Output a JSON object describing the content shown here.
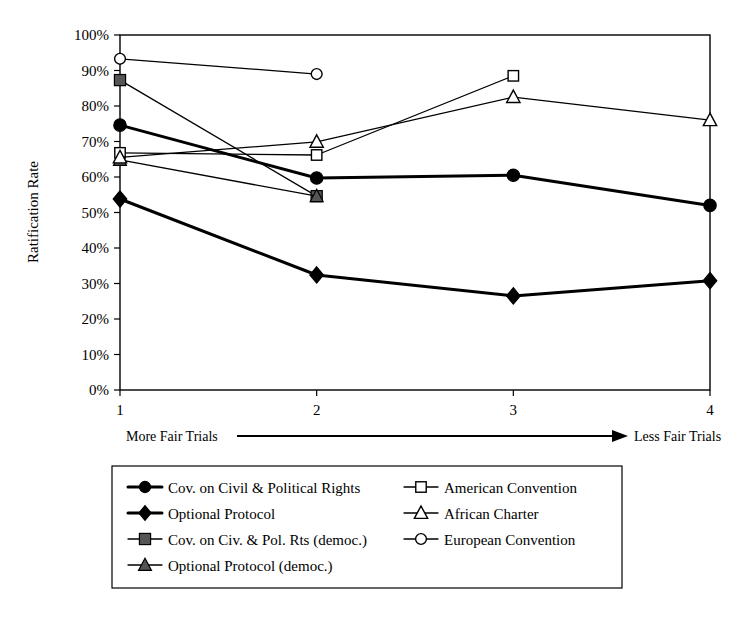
{
  "chart_data": {
    "type": "line",
    "title": "",
    "subtitle": "",
    "xlabel": "",
    "ylabel": "Ratification Rate",
    "x": [
      1,
      2,
      3,
      4
    ],
    "categories": [
      "1",
      "2",
      "3",
      "4"
    ],
    "xlim": [
      1,
      4
    ],
    "ylim": [
      0,
      100
    ],
    "ytick_labels": [
      "0%",
      "10%",
      "20%",
      "30%",
      "40%",
      "50%",
      "60%",
      "70%",
      "80%",
      "90%",
      "100%"
    ],
    "ytick_values": [
      0,
      10,
      20,
      30,
      40,
      50,
      60,
      70,
      80,
      90,
      100
    ],
    "xtick_labels": [
      "1",
      "2",
      "3",
      "4"
    ],
    "grid": false,
    "legend_position": "below-plot",
    "annotations": [
      {
        "name": "x-axis-direction",
        "left_text": "More Fair Trials",
        "right_text": "Less Fair Trials",
        "arrow": "right"
      }
    ],
    "series": [
      {
        "name": "Cov. on Civil & Political Rights",
        "marker": "filled-circle",
        "line_weight": "thick",
        "x": [
          1,
          2,
          3,
          4
        ],
        "values": [
          74.6,
          59.7,
          60.5,
          52.0
        ]
      },
      {
        "name": "Optional Protocol",
        "marker": "filled-diamond",
        "line_weight": "thick",
        "x": [
          1,
          2,
          3,
          4
        ],
        "values": [
          53.8,
          32.4,
          26.5,
          30.8
        ]
      },
      {
        "name": "Cov. on Civ. & Pol. Rts (democ.)",
        "marker": "shaded-square",
        "line_weight": "thin",
        "x": [
          1,
          2
        ],
        "values": [
          87.3,
          54.6
        ]
      },
      {
        "name": "Optional Protocol (democ.)",
        "marker": "shaded-triangle",
        "line_weight": "thin",
        "x": [
          1,
          2
        ],
        "values": [
          64.8,
          54.6
        ]
      },
      {
        "name": "American Convention",
        "marker": "open-square",
        "line_weight": "thin",
        "x": [
          1,
          2,
          3
        ],
        "values": [
          66.8,
          66.2,
          88.5
        ]
      },
      {
        "name": "African Charter",
        "marker": "open-triangle",
        "line_weight": "thin",
        "x": [
          1,
          2,
          3,
          4
        ],
        "values": [
          65.5,
          69.9,
          82.5,
          76.0
        ]
      },
      {
        "name": "European Convention",
        "marker": "open-circle",
        "line_weight": "thin",
        "x": [
          1,
          2
        ],
        "values": [
          93.3,
          89.0
        ]
      }
    ]
  },
  "legend": {
    "entries": [
      {
        "label": "Cov. on Civil & Political Rights",
        "marker": "filled-circle",
        "column": "left"
      },
      {
        "label": "Optional Protocol",
        "marker": "filled-diamond",
        "column": "left"
      },
      {
        "label": "Cov. on Civ. & Pol. Rts (democ.)",
        "marker": "shaded-square",
        "column": "left"
      },
      {
        "label": "Optional Protocol (democ.)",
        "marker": "shaded-triangle",
        "column": "left"
      },
      {
        "label": "American Convention",
        "marker": "open-square",
        "column": "right"
      },
      {
        "label": "African Charter",
        "marker": "open-triangle",
        "column": "right"
      },
      {
        "label": "European Convention",
        "marker": "open-circle",
        "column": "right"
      }
    ]
  },
  "axis": {
    "y_title": "Ratification Rate",
    "x_left_annotation": "More Fair Trials",
    "x_right_annotation": "Less Fair Trials"
  },
  "colors": {
    "ink": "#000000",
    "background": "#ffffff",
    "shaded_marker": "#555555"
  }
}
